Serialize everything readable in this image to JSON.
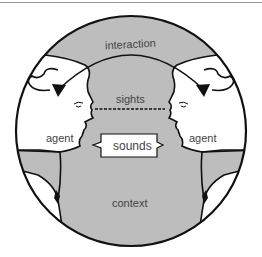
{
  "diagram": {
    "labels": {
      "interaction": "interaction",
      "sights": "sights",
      "sounds": "sounds",
      "context": "context",
      "agent_left": "agent",
      "agent_right": "agent"
    },
    "colors": {
      "background": "#ffffff",
      "context_fill": "#bdbdbd",
      "face_fill": "#ffffff",
      "stroke": "#111111",
      "text": "#444444"
    }
  }
}
